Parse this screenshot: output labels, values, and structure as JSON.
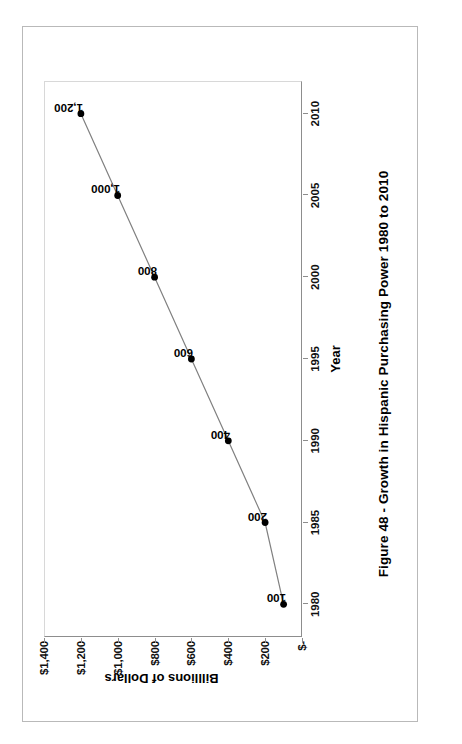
{
  "document": {
    "caption": "Figure 48 - Growth in Hispanic Purchasing Power 1980 to 2010",
    "page_rotation_degrees": -90
  },
  "chart_data": {
    "type": "line",
    "title": "",
    "xlabel": "Year",
    "ylabel": "Billlions of Dollars",
    "x": [
      1980,
      1985,
      1990,
      1995,
      2000,
      2005,
      2010
    ],
    "values": [
      100,
      200,
      400,
      600,
      800,
      1000,
      1200
    ],
    "point_labels": [
      "100",
      "200",
      "400",
      "600",
      "800",
      "1,000",
      "1,200"
    ],
    "xtick_labels": [
      "1980",
      "1985",
      "1990",
      "1995",
      "2000",
      "2005",
      "2010"
    ],
    "ytick_labels": [
      "$1,400",
      "$1,200",
      "$1,000",
      "$800",
      "$600",
      "$400",
      "$200",
      "$-"
    ],
    "ytick_values": [
      1400,
      1200,
      1000,
      800,
      600,
      400,
      200,
      0
    ],
    "xlim": [
      1978,
      2012
    ],
    "ylim": [
      0,
      1400
    ],
    "grid": false,
    "legend": "none",
    "marker": "filled-circle",
    "line_color": "#808080",
    "marker_color": "#000000",
    "axis_color": "#8d8d8d",
    "text_color": "#000000"
  }
}
